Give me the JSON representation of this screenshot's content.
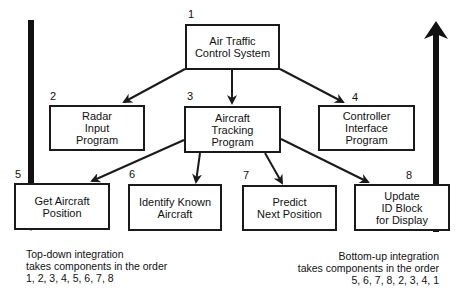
{
  "diagram": {
    "nodes": [
      {
        "id": "1",
        "number": "1",
        "lines": [
          "Air Traffic",
          "Control System"
        ]
      },
      {
        "id": "2",
        "number": "2",
        "lines": [
          "Radar",
          "Input",
          "Program"
        ]
      },
      {
        "id": "3",
        "number": "3",
        "lines": [
          "Aircraft",
          "Tracking",
          "Program"
        ]
      },
      {
        "id": "4",
        "number": "4",
        "lines": [
          "Controller",
          "Interface",
          "Program"
        ]
      },
      {
        "id": "5",
        "number": "5",
        "lines": [
          "Get Aircraft",
          "Position"
        ]
      },
      {
        "id": "6",
        "number": "6",
        "lines": [
          "Identify Known",
          "Aircraft"
        ]
      },
      {
        "id": "7",
        "number": "7",
        "lines": [
          "Predict",
          "Next Position"
        ]
      },
      {
        "id": "8",
        "number": "8",
        "lines": [
          "Update",
          "ID Block",
          "for Display"
        ]
      }
    ],
    "edges": [
      {
        "from": "1",
        "to": "2"
      },
      {
        "from": "1",
        "to": "3"
      },
      {
        "from": "1",
        "to": "4"
      },
      {
        "from": "3",
        "to": "5"
      },
      {
        "from": "3",
        "to": "6"
      },
      {
        "from": "3",
        "to": "7"
      },
      {
        "from": "3",
        "to": "8"
      }
    ],
    "top_down": {
      "direction": "down",
      "caption": [
        "Top-down integration",
        "takes components in the order",
        "1, 2, 3, 4, 5, 6, 7, 8"
      ]
    },
    "bottom_up": {
      "direction": "up",
      "caption": [
        "Bottom-up integration",
        "takes components in the order",
        "5, 6, 7, 8, 2, 3, 4, 1"
      ]
    }
  }
}
